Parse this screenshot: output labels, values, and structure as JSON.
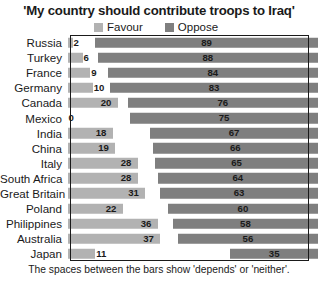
{
  "chart_data": {
    "type": "bar",
    "title": "'My country should contribute troops to Iraq'",
    "subtitle": "",
    "xlabel": "",
    "ylabel": "",
    "xlim": [
      0,
      100
    ],
    "grid": false,
    "orientation": "horizontal",
    "layout": "diverging-stacked",
    "legend_position": "top",
    "footnote": "The spaces between the bars show 'depends' or 'neither'.",
    "categories": [
      "Russia",
      "Turkey",
      "France",
      "Germany",
      "Canada",
      "Mexico",
      "India",
      "China",
      "Italy",
      "South Africa",
      "Great Britain",
      "Poland",
      "Philippines",
      "Australia",
      "Japan"
    ],
    "series": [
      {
        "name": "Favour",
        "color": "#b2b2b2",
        "align": "left",
        "values": [
          2,
          6,
          9,
          10,
          20,
          0,
          18,
          19,
          28,
          28,
          31,
          22,
          36,
          37,
          11
        ]
      },
      {
        "name": "Oppose",
        "color": "#7f7f7f",
        "align": "right",
        "values": [
          89,
          88,
          84,
          83,
          76,
          75,
          67,
          66,
          65,
          64,
          63,
          60,
          58,
          56,
          35
        ]
      }
    ]
  },
  "legend": {
    "items": [
      {
        "label": "Favour",
        "color": "#b2b2b2"
      },
      {
        "label": "Oppose",
        "color": "#7f7f7f"
      }
    ]
  }
}
